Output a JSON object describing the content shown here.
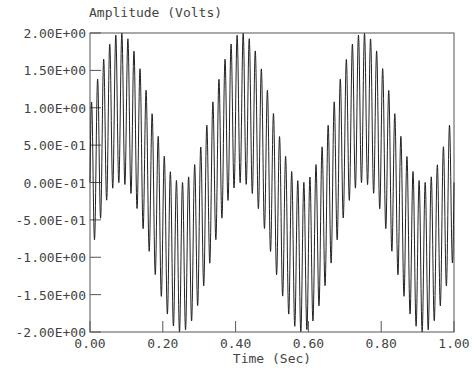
{
  "chart_data": {
    "type": "line",
    "title": "",
    "ylabel": "Amplitude (Volts)",
    "xlabel": "Time (Sec)",
    "xlim": [
      0.0,
      1.0
    ],
    "ylim": [
      -2.0,
      2.0
    ],
    "grid": false,
    "legend": null,
    "x_ticks": [
      {
        "value": 0.0,
        "label": "0.00"
      },
      {
        "value": 0.2,
        "label": "0.20"
      },
      {
        "value": 0.4,
        "label": "0.40"
      },
      {
        "value": 0.6,
        "label": "0.60"
      },
      {
        "value": 0.8,
        "label": "0.80"
      },
      {
        "value": 1.0,
        "label": "1.00"
      }
    ],
    "y_ticks": [
      {
        "value": 2.0,
        "label": "2.00E+00"
      },
      {
        "value": 1.5,
        "label": "1.50E+00"
      },
      {
        "value": 1.0,
        "label": "1.00E+00"
      },
      {
        "value": 0.5,
        "label": "5.00E-01"
      },
      {
        "value": 0.0,
        "label": "0.00E-01"
      },
      {
        "value": -0.5,
        "label": "-5.00E-01"
      },
      {
        "value": -1.0,
        "label": "-1.00E+00"
      },
      {
        "value": -1.5,
        "label": "-1.50E+00"
      },
      {
        "value": -2.0,
        "label": "-2.00E+00"
      }
    ],
    "series": [
      {
        "name": "signal",
        "description": "Sum of two sinusoids: 3 Hz and 60 Hz, each amplitude 1 V",
        "components": [
          {
            "frequency_hz": 3,
            "amplitude": 1.0,
            "phase": 0
          },
          {
            "frequency_hz": 60,
            "amplitude": 1.0,
            "phase": 0
          }
        ],
        "sample_count": 2001,
        "color": "#222222",
        "envelope_peaks": [
          {
            "x": 0.083,
            "y": 2.0
          },
          {
            "x": 0.417,
            "y": 2.0
          },
          {
            "x": 0.75,
            "y": 2.0
          }
        ],
        "envelope_troughs": [
          {
            "x": 0.25,
            "y": -2.0
          },
          {
            "x": 0.583,
            "y": -2.0
          },
          {
            "x": 0.917,
            "y": -2.0
          }
        ]
      }
    ]
  },
  "colors": {
    "background": "#ffffff",
    "axis": "#555555",
    "line": "#222222",
    "text": "#444444"
  }
}
